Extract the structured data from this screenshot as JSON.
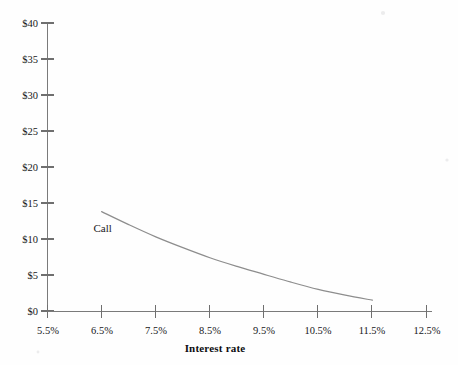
{
  "chart_data": {
    "type": "line",
    "title": "",
    "subtitle": "",
    "xlabel": "Interest rate",
    "ylabel": "",
    "xlim": [
      5.5,
      12.5
    ],
    "ylim": [
      0,
      40
    ],
    "grid": false,
    "legend_position": "inline-annotation",
    "x_tick_labels": [
      "5.5%",
      "6.5%",
      "7.5%",
      "8.5%",
      "9.5%",
      "10.5%",
      "11.5%",
      "12.5%"
    ],
    "x_tick_values": [
      5.5,
      6.5,
      7.5,
      8.5,
      9.5,
      10.5,
      11.5,
      12.5
    ],
    "y_tick_labels": [
      "$0",
      "$5",
      "$10",
      "$15",
      "$20",
      "$25",
      "$30",
      "$35",
      "$40"
    ],
    "y_tick_values": [
      0,
      5,
      10,
      15,
      20,
      25,
      30,
      35,
      40
    ],
    "series": [
      {
        "name": "Call",
        "color": "#8d8d8d",
        "annotation": "Call",
        "annotation_x": 6.35,
        "annotation_y": 11.0,
        "x": [
          6.5,
          7.0,
          7.5,
          8.0,
          8.5,
          9.0,
          9.5,
          10.0,
          10.5,
          11.0,
          11.5
        ],
        "values": [
          13.8,
          12.0,
          10.3,
          8.8,
          7.4,
          6.2,
          5.1,
          4.0,
          3.0,
          2.2,
          1.5
        ]
      }
    ]
  },
  "figure": {
    "background_color": "#fefefe",
    "axis_color": "#7a7a7a",
    "text_color": "#17171a"
  }
}
